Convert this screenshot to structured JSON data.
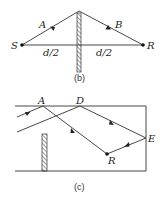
{
  "figure_b": {
    "caption": "(b)",
    "labels": {
      "source": "S",
      "receiver": "R",
      "ray_a": "A",
      "ray_b": "B",
      "left_distance": "d/2",
      "right_distance": "d/2"
    }
  },
  "figure_c": {
    "caption": "(c)",
    "labels": {
      "point_a": "A",
      "point_d": "D",
      "point_e": "E",
      "receiver": "R"
    }
  },
  "colors": {
    "line": "#333333",
    "background": "#ffffff"
  }
}
